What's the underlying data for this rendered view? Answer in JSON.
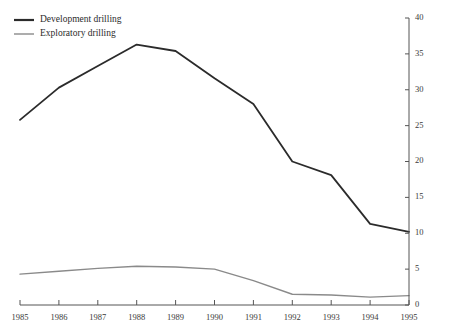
{
  "chart_data": {
    "type": "line",
    "title": "",
    "subtitle": "",
    "xlabel": "",
    "ylabel": "",
    "x": [
      1985,
      1986,
      1987,
      1988,
      1989,
      1990,
      1991,
      1992,
      1993,
      1994,
      1995
    ],
    "categories": [
      "1985",
      "1986",
      "1987",
      "1988",
      "1989",
      "1990",
      "1991",
      "1992",
      "1993",
      "1994",
      "1995"
    ],
    "series": [
      {
        "name": "Development drilling",
        "color": "#2b2b2b",
        "linewidth": 1.8,
        "values": [
          25.8,
          30.3,
          33.3,
          36.3,
          35.4,
          31.6,
          28.0,
          20.0,
          18.1,
          11.3,
          10.2
        ]
      },
      {
        "name": "Exploratory drilling",
        "color": "#8a8a8a",
        "linewidth": 1.4,
        "values": [
          4.3,
          4.7,
          5.1,
          5.4,
          5.3,
          5.0,
          3.4,
          1.5,
          1.4,
          1.1,
          1.3
        ]
      }
    ],
    "xlim": [
      1985,
      1995
    ],
    "ylim": [
      0,
      40
    ],
    "yticks": [
      0,
      5,
      10,
      15,
      20,
      25,
      30,
      35,
      40
    ],
    "ytick_labels": [
      "0",
      "5",
      "10",
      "15",
      "20",
      "25",
      "30",
      "35",
      "40"
    ],
    "xticks": [
      1985,
      1986,
      1987,
      1988,
      1989,
      1990,
      1991,
      1992,
      1993,
      1994,
      1995
    ],
    "xtick_labels": [
      "1985",
      "1986",
      "1987",
      "1988",
      "1989",
      "1990",
      "1991",
      "1992",
      "1993",
      "1994",
      "1995"
    ],
    "yaxis_position": "right",
    "xaxis_position": "bottom",
    "grid": false,
    "legend_position": "top-left",
    "legend": [
      {
        "label": "Development drilling",
        "color": "#2b2b2b",
        "linewidth": 2.2
      },
      {
        "label": "Exploratory drilling",
        "color": "#8a8a8a",
        "linewidth": 1.4
      }
    ],
    "background_color": "#ffffff",
    "axis_color": "#555555"
  }
}
